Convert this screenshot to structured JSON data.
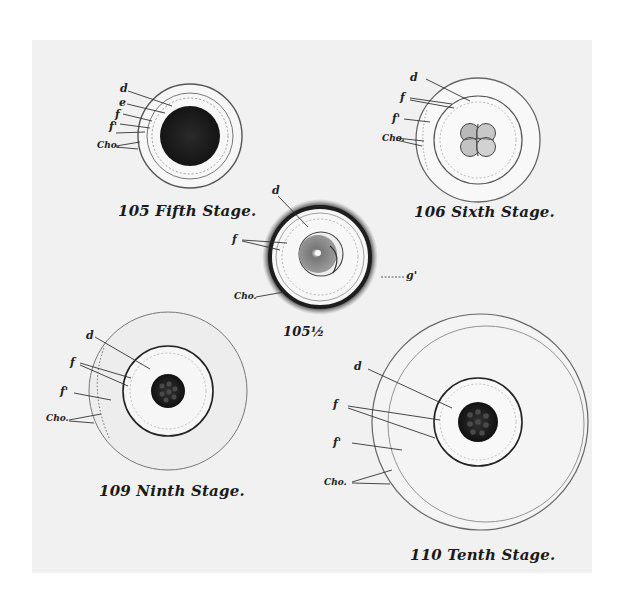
{
  "plate": {
    "background": "#f1f1f1",
    "ink": "#1a1a1a"
  },
  "figures": [
    {
      "id": "105",
      "caption": "105 Fifth Stage.",
      "labels": [
        "d",
        "e",
        "f",
        "f'",
        "Cho."
      ]
    },
    {
      "id": "106",
      "caption": "106 Sixth Stage.",
      "labels": [
        "d",
        "f",
        "f'",
        "Cho."
      ]
    },
    {
      "id": "105half",
      "caption": "105½",
      "labels": [
        "d",
        "f",
        "g'",
        "Cho."
      ]
    },
    {
      "id": "109",
      "caption": "109 Ninth Stage.",
      "labels": [
        "d",
        "f",
        "f'",
        "Cho."
      ]
    },
    {
      "id": "110",
      "caption": "110 Tenth Stage.",
      "labels": [
        "d",
        "f",
        "f'",
        "Cho."
      ]
    }
  ]
}
